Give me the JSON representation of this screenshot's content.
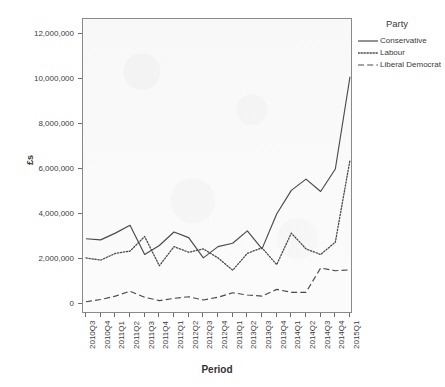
{
  "chart_data": {
    "type": "line",
    "title": "",
    "xlabel": "Period",
    "ylabel": "£s",
    "ylim": [
      0,
      12000000
    ],
    "yticks": [
      0,
      2000000,
      4000000,
      6000000,
      8000000,
      10000000,
      12000000
    ],
    "ytick_labels": [
      "0",
      "2,000,000",
      "4,000,000",
      "6,000,000",
      "8,000,000",
      "10,000,000",
      "12,000,000"
    ],
    "grid": false,
    "legend_position": "right",
    "legend_title": "Party",
    "categories": [
      "2010Q3",
      "2010Q4",
      "2011Q1",
      "2011Q2",
      "2011Q3",
      "2011Q4",
      "2012Q1",
      "2012Q2",
      "2012Q3",
      "2012Q4",
      "2013Q1",
      "2013Q2",
      "2013Q3",
      "2013Q4",
      "2014Q1",
      "2014Q2",
      "2014Q3",
      "2014Q4",
      "2015Q1"
    ],
    "series": [
      {
        "name": "Conservative",
        "style": "solid",
        "color": "#4a4a4a",
        "values": [
          2900000,
          2850000,
          3150000,
          3500000,
          2200000,
          2600000,
          3200000,
          2950000,
          2050000,
          2550000,
          2700000,
          3250000,
          2450000,
          4000000,
          5050000,
          5550000,
          5000000,
          6000000,
          10100000
        ]
      },
      {
        "name": "Labour",
        "style": "dotted",
        "color": "#4a4a4a",
        "values": [
          2050000,
          1950000,
          2250000,
          2350000,
          3000000,
          1700000,
          2550000,
          2300000,
          2450000,
          2050000,
          1500000,
          2250000,
          2500000,
          1750000,
          3150000,
          2450000,
          2200000,
          2750000,
          6400000
        ]
      },
      {
        "name": "Liberal Democrat",
        "style": "dashed",
        "color": "#4a4a4a",
        "values": [
          100000,
          200000,
          350000,
          570000,
          300000,
          150000,
          250000,
          320000,
          180000,
          300000,
          500000,
          400000,
          350000,
          650000,
          520000,
          520000,
          1600000,
          1480000,
          1520000
        ]
      }
    ]
  },
  "axes": {
    "y_title": "£s",
    "x_title": "Period"
  },
  "legend": {
    "title": "Party",
    "items": [
      {
        "label": "Conservative",
        "style": "solid"
      },
      {
        "label": "Labour",
        "style": "dotted"
      },
      {
        "label": "Liberal Democrat",
        "style": "dashed"
      }
    ]
  }
}
